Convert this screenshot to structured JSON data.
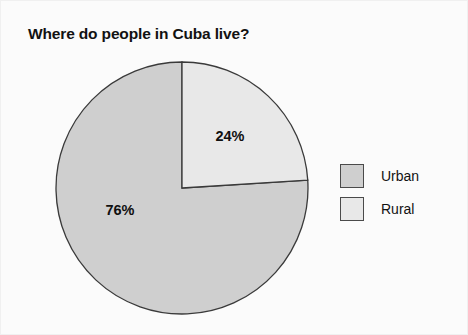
{
  "chart_data": {
    "type": "pie",
    "title": "Where do people in Cuba live?",
    "categories": [
      "Urban",
      "Rural"
    ],
    "values": [
      76,
      24
    ],
    "labels": [
      "76%",
      "24%"
    ],
    "colors": [
      "#cfcfcf",
      "#e8e8e8"
    ],
    "outline_color": "#3a3a3a",
    "start_angle_deg": 0,
    "direction": "clockwise",
    "legend_position": "right",
    "legend": [
      {
        "label": "Urban",
        "color": "#cfcfcf",
        "value": 76
      },
      {
        "label": "Rural",
        "color": "#e8e8e8",
        "value": 24
      }
    ],
    "xlabel": "",
    "ylabel": "",
    "grid": false
  },
  "geometry": {
    "center_x": 127,
    "center_y": 127,
    "radius": 126,
    "urban_label_x": 65,
    "urban_label_y": 154,
    "rural_label_x": 175,
    "rural_label_y": 80
  }
}
